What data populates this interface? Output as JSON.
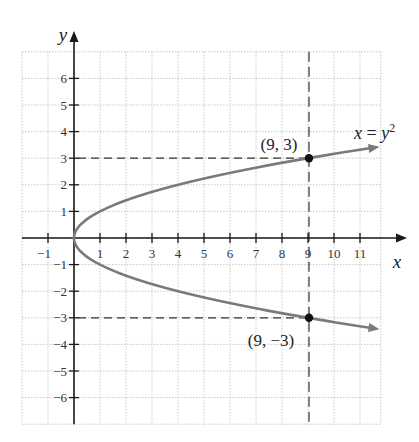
{
  "chart_data": {
    "type": "line",
    "title": "",
    "xlabel": "x",
    "ylabel": "y",
    "xlim": [
      -2,
      11.8
    ],
    "ylim": [
      -7,
      7
    ],
    "grid": true,
    "x_ticks": [
      -1,
      1,
      2,
      3,
      4,
      5,
      6,
      7,
      8,
      9,
      10,
      11
    ],
    "x_tick_labels": [
      "−1",
      "1",
      "2",
      "3",
      "4",
      "5",
      "6",
      "7",
      "8",
      "9",
      "10",
      "11"
    ],
    "y_ticks": [
      6,
      5,
      4,
      3,
      2,
      1,
      -1,
      -2,
      -3,
      -4,
      -5,
      -6
    ],
    "y_tick_labels": [
      "6",
      "5",
      "4",
      "3",
      "2",
      "1",
      "−1",
      "−2",
      "−3",
      "−4",
      "−5",
      "−6"
    ],
    "series": [
      {
        "name": "x = y^2",
        "label": "x = y",
        "label_superscript": "2",
        "equation": "x = y^2",
        "y_range": [
          -3.4,
          3.4
        ],
        "color": "#7a7a7a",
        "arrows_at_ends": true
      }
    ],
    "points": [
      {
        "x": 9,
        "y": 3,
        "label": "(9, 3)"
      },
      {
        "x": 9,
        "y": -3,
        "label": "(9, −3)"
      }
    ],
    "guide_lines": [
      {
        "type": "horizontal-dashed",
        "y": 3,
        "from_x": 0,
        "to_x": 9
      },
      {
        "type": "horizontal-dashed",
        "y": -3,
        "from_x": 0,
        "to_x": 9
      },
      {
        "type": "vertical-dashed",
        "x": 9,
        "full_height": true
      }
    ]
  },
  "colors": {
    "axis": "#1a1a1a",
    "curve": "#7a7a7a",
    "grid": "#c8c8c8",
    "point": "#111111",
    "dash": "#333333"
  }
}
